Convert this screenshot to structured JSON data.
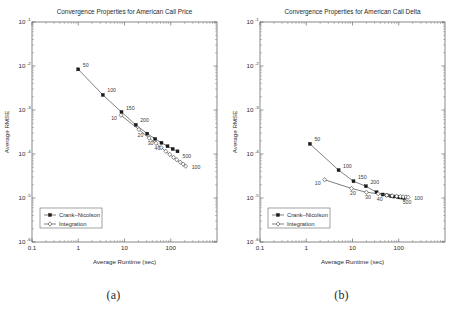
{
  "figure": {
    "subcaptions": [
      "(a)",
      "(b)"
    ]
  },
  "chart_data": [
    {
      "type": "line",
      "panel": "a",
      "title": "Convergence Properties for American Call Price",
      "xlabel": "Average Runtime (sec)",
      "ylabel": "Average RMSE",
      "xscale": "log",
      "yscale": "log",
      "xlim": [
        0.1,
        1000
      ],
      "ylim": [
        1e-06,
        0.1
      ],
      "xticks": [
        "0.1",
        "1",
        "10",
        "100"
      ],
      "xtick_values": [
        0.1,
        1,
        10,
        100
      ],
      "yticks": [
        "10",
        "10",
        "10",
        "10",
        "10",
        "10"
      ],
      "ytick_exponents": [
        "-1",
        "-2",
        "-3",
        "-4",
        "-5",
        "-6"
      ],
      "ytick_values": [
        0.1,
        0.01,
        0.001,
        0.0001,
        1e-05,
        1e-06
      ],
      "grid": false,
      "legend_position": "lower left",
      "series": [
        {
          "name": "Crank-Nicolson",
          "marker": "filled-square",
          "x": [
            1.0,
            3.4,
            8.6,
            17.5,
            31.0,
            46.0,
            63.0,
            85.0,
            110.0,
            140.0
          ],
          "y": [
            0.0084,
            0.0022,
            0.0009,
            0.00046,
            0.00029,
            0.00022,
            0.00018,
            0.00015,
            0.00013,
            0.000115
          ],
          "point_labels": [
            {
              "label": "50",
              "index": 0
            },
            {
              "label": "100",
              "index": 1
            },
            {
              "label": "150",
              "index": 2
            },
            {
              "label": "200",
              "index": 3
            },
            {
              "label": "500",
              "index": 9
            }
          ]
        },
        {
          "name": "Integration",
          "marker": "open-diamond",
          "x": [
            8.4,
            20.5,
            34.0,
            48.0,
            62.0,
            78.0,
            95.0,
            115.0,
            135.0,
            160.0,
            185.0,
            210.0
          ],
          "y": [
            0.00076,
            0.00036,
            0.00023,
            0.000175,
            0.00014,
            0.000115,
            9.8e-05,
            8.4e-05,
            7.4e-05,
            6.5e-05,
            5.9e-05,
            5.3e-05
          ],
          "point_labels": [
            {
              "label": "10",
              "index": 0
            },
            {
              "label": "20",
              "index": 1
            },
            {
              "label": "30",
              "index": 2
            },
            {
              "label": "40",
              "index": 3
            },
            {
              "label": "100",
              "index": 11
            }
          ]
        }
      ]
    },
    {
      "type": "line",
      "panel": "b",
      "title": "Convergence Properties for American Call Delta",
      "xlabel": "Average Runtime (sec)",
      "ylabel": "Average RMSE",
      "xscale": "log",
      "yscale": "log",
      "xlim": [
        0.1,
        1000
      ],
      "ylim": [
        1e-06,
        0.1
      ],
      "xticks": [
        "0.1",
        "1",
        "10",
        "100"
      ],
      "xtick_values": [
        0.1,
        1,
        10,
        100
      ],
      "yticks": [
        "10",
        "10",
        "10",
        "10",
        "10",
        "10"
      ],
      "ytick_exponents": [
        "-1",
        "-2",
        "-3",
        "-4",
        "-5",
        "-6"
      ],
      "ytick_values": [
        0.1,
        0.01,
        0.001,
        0.0001,
        1e-05,
        1e-06
      ],
      "grid": false,
      "legend_position": "lower left",
      "series": [
        {
          "name": "Crank-Nicolson",
          "marker": "filled-square",
          "x": [
            1.2,
            5.0,
            10.5,
            19.5,
            33.0,
            45.0,
            56.0,
            68.0,
            80.0,
            95.0,
            108.0,
            120.0,
            133.0
          ],
          "y": [
            0.00017,
            4.3e-05,
            2.4e-05,
            1.85e-05,
            1.35e-05,
            1.2e-05,
            1.15e-05,
            1.1e-05,
            1.08e-05,
            1.05e-05,
            1.03e-05,
            1.02e-05,
            1e-05
          ],
          "point_labels": [
            {
              "label": "50",
              "index": 0
            },
            {
              "label": "100",
              "index": 1
            },
            {
              "label": "150",
              "index": 2
            },
            {
              "label": "200",
              "index": 3
            },
            {
              "label": "500",
              "index": 9
            }
          ]
        },
        {
          "name": "Integration",
          "marker": "open-diamond",
          "x": [
            2.5,
            9.5,
            20.0,
            36.0,
            55.0,
            72.0,
            90.0,
            108.0,
            125.0,
            143.0,
            160.0
          ],
          "y": [
            2.6e-05,
            1.65e-05,
            1.35e-05,
            1.25e-05,
            1.15e-05,
            1.12e-05,
            1.1e-05,
            1.08e-05,
            1.06e-05,
            1.05e-05,
            1.04e-05
          ],
          "point_labels": [
            {
              "label": "10",
              "index": 0
            },
            {
              "label": "20",
              "index": 1
            },
            {
              "label": "30",
              "index": 2
            },
            {
              "label": "40",
              "index": 3
            },
            {
              "label": "100",
              "index": 10
            }
          ]
        }
      ]
    }
  ]
}
